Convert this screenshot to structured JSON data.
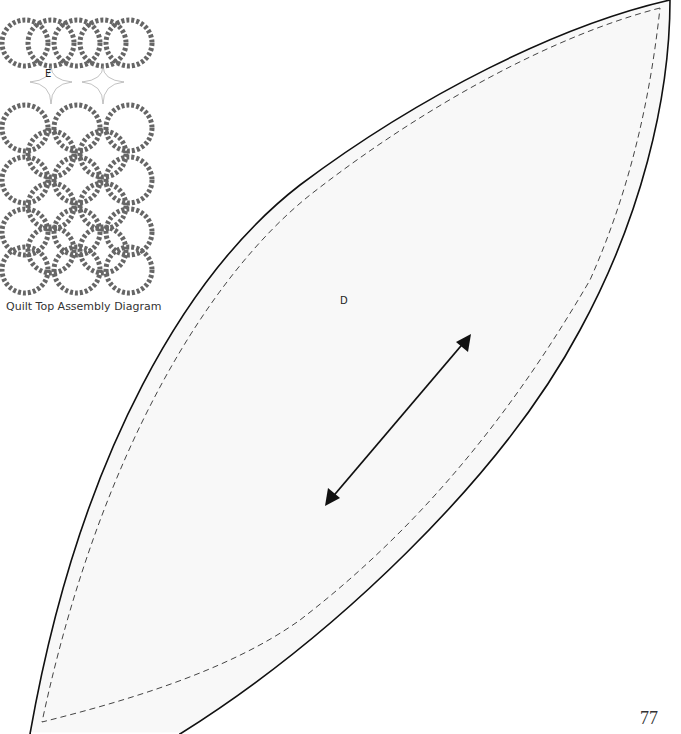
{
  "header": {
    "cut_text": "Quilt Top Assembly"
  },
  "diagram": {
    "caption": "Quilt Top Assembly Diagram",
    "piece_label": "E",
    "ring_columns": 3,
    "ring_rows": 5
  },
  "template": {
    "piece_label": "D",
    "grainline": "double-headed-arrow",
    "outline": "solid",
    "seam_line": "dashed"
  },
  "footer": {
    "page_number": "77"
  }
}
